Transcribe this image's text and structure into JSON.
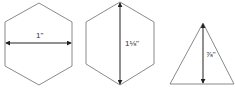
{
  "figure": {
    "shapes": [
      {
        "id": "hexagon-width",
        "type": "hexagon",
        "orientation": "pointy-top",
        "dimension": "width",
        "label": "1\""
      },
      {
        "id": "hexagon-height",
        "type": "hexagon",
        "orientation": "pointy-top",
        "dimension": "height",
        "label": "1⅛\""
      },
      {
        "id": "triangle-height",
        "type": "triangle",
        "orientation": "point-up",
        "dimension": "height",
        "label": "⅞\""
      }
    ]
  },
  "colors": {
    "outline": "#8a8a8a",
    "arrow": "#222222",
    "text": "#333333",
    "background": "#ffffff"
  }
}
